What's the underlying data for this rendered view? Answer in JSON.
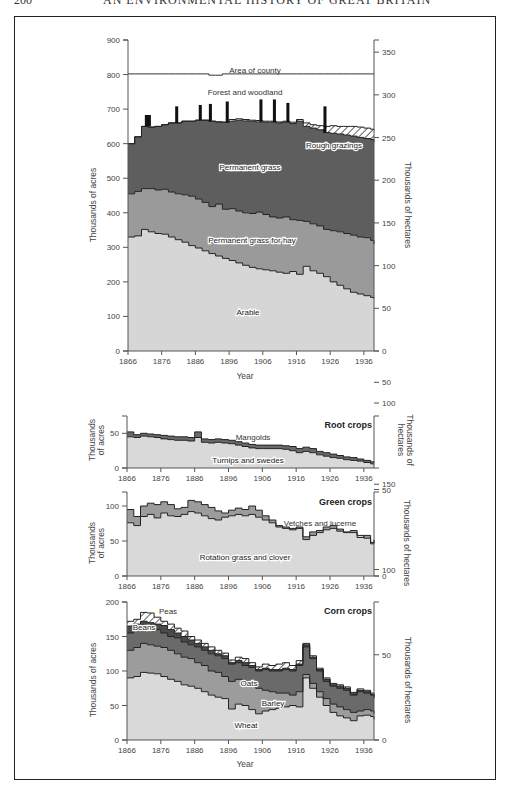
{
  "header": {
    "page_number": "200",
    "running_title": "AN ENVIRONMENTAL HISTORY OF GREAT BRITAIN"
  },
  "colors": {
    "arable": "#d6d6d6",
    "hay": "#9a9a9a",
    "permanent_grass": "#5e5e5e",
    "forest": "#111111",
    "rough": "#ffffff",
    "line": "#222222",
    "light": "#d9d9d9",
    "mid": "#9c9c9c",
    "dark": "#6a6a6a",
    "darker": "#4a4a4a"
  },
  "chart_data": [
    {
      "id": "land_use",
      "type": "area",
      "title": "",
      "xlabel": "Year",
      "ylabel": "Thousands of acres",
      "ylabel_right": "Thousands of hectares",
      "xlim": [
        1866,
        1939
      ],
      "ylim": [
        0,
        900
      ],
      "xticks": [
        "1866",
        "1876",
        "1886",
        "1896",
        "1906",
        "1916",
        "1926",
        "1936"
      ],
      "yticks": [
        "0",
        "100",
        "200",
        "300",
        "400",
        "500",
        "600",
        "700",
        "800",
        "900"
      ],
      "yticks_right": [
        "0",
        "50",
        "100",
        "150",
        "200",
        "250",
        "300",
        "350"
      ],
      "labels": {
        "area": "Area of county",
        "forest": "Forest and woodland",
        "rough": "Rough grazings",
        "perm": "Permanent grass",
        "hay": "Permanent grass for hay",
        "arable": "Arable"
      },
      "x": [
        1866,
        1868,
        1870,
        1872,
        1874,
        1876,
        1878,
        1880,
        1882,
        1884,
        1886,
        1888,
        1890,
        1892,
        1894,
        1896,
        1898,
        1900,
        1902,
        1904,
        1906,
        1908,
        1910,
        1912,
        1914,
        1916,
        1918,
        1920,
        1922,
        1924,
        1926,
        1928,
        1930,
        1932,
        1934,
        1936,
        1938,
        1939
      ],
      "series": [
        {
          "name": "Arable",
          "values": [
            330,
            333,
            352,
            345,
            340,
            338,
            330,
            322,
            315,
            305,
            298,
            290,
            282,
            275,
            268,
            262,
            255,
            248,
            242,
            238,
            235,
            232,
            228,
            225,
            230,
            222,
            245,
            232,
            225,
            215,
            200,
            190,
            180,
            170,
            165,
            160,
            155,
            152
          ]
        },
        {
          "name": "Permanent grass for hay",
          "values": [
            455,
            462,
            470,
            470,
            466,
            468,
            460,
            455,
            452,
            448,
            440,
            430,
            418,
            425,
            410,
            412,
            405,
            400,
            398,
            402,
            395,
            388,
            385,
            388,
            380,
            378,
            375,
            368,
            362,
            352,
            348,
            345,
            340,
            335,
            330,
            328,
            320,
            310
          ]
        },
        {
          "name": "Permanent grass",
          "values": [
            600,
            620,
            650,
            648,
            650,
            655,
            660,
            660,
            665,
            665,
            668,
            668,
            665,
            663,
            662,
            665,
            668,
            666,
            665,
            663,
            662,
            662,
            660,
            662,
            658,
            665,
            650,
            645,
            640,
            632,
            630,
            628,
            625,
            622,
            618,
            615,
            612,
            605
          ]
        },
        {
          "name": "Rough grazings (top)",
          "values": [
            600,
            620,
            650,
            648,
            650,
            655,
            660,
            660,
            665,
            665,
            668,
            668,
            665,
            663,
            662,
            670,
            672,
            670,
            668,
            667,
            665,
            665,
            663,
            665,
            662,
            670,
            660,
            655,
            652,
            650,
            652,
            650,
            650,
            650,
            648,
            645,
            642,
            640
          ]
        },
        {
          "name": "Area of county",
          "values": [
            802,
            802,
            802,
            802,
            802,
            802,
            802,
            802,
            802,
            802,
            802,
            802,
            798,
            798,
            802,
            802,
            802,
            802,
            802,
            802,
            802,
            802,
            802,
            802,
            802,
            802,
            802,
            802,
            802,
            802,
            802,
            802,
            802,
            802,
            802,
            802,
            802,
            802
          ]
        }
      ],
      "forest_bars": [
        {
          "year": 1871,
          "width": 2,
          "top": 683
        },
        {
          "year": 1880,
          "width": 1,
          "top": 708
        },
        {
          "year": 1887,
          "width": 1,
          "top": 712
        },
        {
          "year": 1890,
          "width": 1,
          "top": 715
        },
        {
          "year": 1895,
          "width": 1,
          "top": 722
        },
        {
          "year": 1905,
          "width": 1,
          "top": 728
        },
        {
          "year": 1909,
          "width": 1,
          "top": 728
        },
        {
          "year": 1913,
          "width": 1,
          "top": 718
        },
        {
          "year": 1924,
          "width": 1,
          "top": 708
        }
      ]
    },
    {
      "id": "root_crops",
      "type": "area",
      "title": "Root crops",
      "ylabel": "Thousands of acres",
      "ylabel_right": "Thousands of hectares",
      "xlim": [
        1866,
        1939
      ],
      "ylim": [
        0,
        75
      ],
      "xticks": [
        "1866",
        "1876",
        "1886",
        "1896",
        "1906",
        "1916",
        "1926",
        "1936"
      ],
      "yticks": [
        "0",
        "50"
      ],
      "yticks_right": [
        "50"
      ],
      "labels": {
        "top": "Mangolds",
        "bottom": "Turnips and swedes"
      },
      "x": [
        1866,
        1868,
        1870,
        1872,
        1874,
        1876,
        1878,
        1880,
        1882,
        1884,
        1886,
        1888,
        1890,
        1892,
        1894,
        1896,
        1898,
        1900,
        1902,
        1904,
        1906,
        1908,
        1910,
        1912,
        1914,
        1916,
        1918,
        1920,
        1922,
        1924,
        1926,
        1928,
        1930,
        1932,
        1934,
        1936,
        1938,
        1939
      ],
      "series": [
        {
          "name": "Turnips and swedes",
          "values": [
            45,
            44,
            46,
            45,
            44,
            42,
            41,
            40,
            40,
            39,
            44,
            37,
            36,
            37,
            36,
            35,
            33,
            31,
            29,
            28,
            28,
            28,
            28,
            27,
            25,
            22,
            24,
            22,
            19,
            17,
            15,
            14,
            12,
            11,
            10,
            8,
            6,
            5
          ]
        },
        {
          "name": "Mangolds (top)",
          "values": [
            52,
            48,
            50,
            49,
            48,
            47,
            46,
            45,
            45,
            44,
            52,
            42,
            41,
            42,
            41,
            40,
            38,
            36,
            34,
            33,
            33,
            33,
            33,
            32,
            31,
            28,
            30,
            28,
            24,
            22,
            20,
            18,
            16,
            15,
            13,
            11,
            9,
            8
          ]
        }
      ]
    },
    {
      "id": "green_crops",
      "type": "area",
      "title": "Green crops",
      "ylabel": "Thousands of acres",
      "ylabel_right": "Thousands of hectares",
      "xlim": [
        1866,
        1939
      ],
      "ylim": [
        0,
        120
      ],
      "xticks": [
        "1866",
        "1876",
        "1886",
        "1896",
        "1906",
        "1916",
        "1926",
        "1936"
      ],
      "yticks": [
        "0",
        "50",
        "100"
      ],
      "yticks_right": [
        "0",
        "50",
        "100"
      ],
      "labels": {
        "top": "Vetches and lucerne",
        "bottom": "Rotation grass and clover"
      },
      "x": [
        1866,
        1868,
        1870,
        1872,
        1874,
        1876,
        1878,
        1880,
        1882,
        1884,
        1886,
        1888,
        1890,
        1892,
        1894,
        1896,
        1898,
        1900,
        1902,
        1904,
        1906,
        1908,
        1910,
        1912,
        1914,
        1916,
        1918,
        1920,
        1922,
        1924,
        1926,
        1928,
        1930,
        1932,
        1934,
        1936,
        1938,
        1939
      ],
      "series": [
        {
          "name": "Rotation grass and clover",
          "values": [
            76,
            72,
            85,
            88,
            83,
            90,
            86,
            85,
            88,
            92,
            90,
            86,
            82,
            80,
            84,
            86,
            88,
            86,
            88,
            84,
            80,
            76,
            70,
            68,
            66,
            68,
            52,
            58,
            62,
            66,
            68,
            64,
            62,
            62,
            58,
            54,
            46,
            50
          ]
        },
        {
          "name": "Vetches and lucerne (top)",
          "values": [
            95,
            85,
            100,
            104,
            102,
            106,
            102,
            96,
            98,
            108,
            106,
            102,
            98,
            93,
            90,
            94,
            97,
            95,
            100,
            94,
            86,
            80,
            72,
            70,
            68,
            70,
            56,
            63,
            65,
            70,
            72,
            67,
            63,
            65,
            55,
            58,
            48,
            52
          ]
        }
      ]
    },
    {
      "id": "corn_crops",
      "type": "area",
      "title": "Corn crops",
      "xlabel": "Year",
      "ylabel": "Thousands of acres",
      "ylabel_right": "Thousands of hectares",
      "xlim": [
        1866,
        1939
      ],
      "ylim": [
        0,
        200
      ],
      "xticks": [
        "1866",
        "1876",
        "1886",
        "1896",
        "1906",
        "1916",
        "1926",
        "1936"
      ],
      "yticks": [
        "0",
        "50",
        "100",
        "150",
        "200"
      ],
      "yticks_right": [
        "0",
        "50",
        "100",
        "150"
      ],
      "labels": {
        "peas": "Peas",
        "beans": "Beans",
        "oats": "Oats",
        "barley": "Barley",
        "wheat": "Wheat"
      },
      "x": [
        1866,
        1868,
        1870,
        1872,
        1874,
        1876,
        1878,
        1880,
        1882,
        1884,
        1886,
        1888,
        1890,
        1892,
        1894,
        1896,
        1898,
        1900,
        1902,
        1904,
        1906,
        1908,
        1910,
        1912,
        1914,
        1916,
        1918,
        1920,
        1922,
        1924,
        1926,
        1928,
        1930,
        1932,
        1934,
        1936,
        1938,
        1939
      ],
      "series": [
        {
          "name": "Wheat",
          "values": [
            90,
            92,
            98,
            97,
            96,
            92,
            88,
            85,
            80,
            78,
            75,
            70,
            65,
            62,
            60,
            45,
            52,
            50,
            44,
            38,
            42,
            44,
            46,
            48,
            50,
            48,
            90,
            75,
            62,
            50,
            40,
            35,
            32,
            28,
            35,
            36,
            34,
            30
          ]
        },
        {
          "name": "Barley",
          "values": [
            130,
            134,
            140,
            138,
            136,
            134,
            130,
            125,
            120,
            118,
            112,
            108,
            100,
            98,
            92,
            85,
            88,
            85,
            80,
            75,
            72,
            70,
            68,
            68,
            65,
            70,
            95,
            82,
            70,
            60,
            52,
            48,
            44,
            40,
            42,
            44,
            42,
            38
          ]
        },
        {
          "name": "Oats",
          "values": [
            155,
            160,
            160,
            158,
            160,
            155,
            150,
            148,
            142,
            138,
            135,
            130,
            125,
            122,
            118,
            110,
            112,
            108,
            105,
            100,
            102,
            100,
            100,
            102,
            100,
            108,
            135,
            118,
            100,
            85,
            78,
            75,
            72,
            65,
            70,
            68,
            65,
            60
          ]
        },
        {
          "name": "Beans",
          "values": [
            165,
            168,
            172,
            170,
            168,
            166,
            160,
            155,
            150,
            145,
            140,
            135,
            130,
            125,
            122,
            112,
            115,
            112,
            108,
            102,
            104,
            102,
            102,
            104,
            102,
            110,
            138,
            120,
            102,
            88,
            80,
            78,
            75,
            67,
            72,
            70,
            66,
            62
          ]
        },
        {
          "name": "Peas",
          "values": [
            172,
            175,
            185,
            184,
            178,
            172,
            168,
            162,
            158,
            150,
            145,
            140,
            135,
            130,
            126,
            116,
            120,
            118,
            112,
            106,
            110,
            108,
            110,
            112,
            108,
            115,
            140,
            122,
            104,
            90,
            82,
            80,
            77,
            69,
            74,
            72,
            68,
            64
          ]
        }
      ]
    }
  ]
}
